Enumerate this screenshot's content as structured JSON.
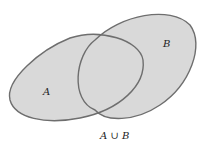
{
  "diagram": {
    "type": "venn",
    "sets": [
      {
        "label": "A"
      },
      {
        "label": "B"
      }
    ],
    "caption": "A ∪ B",
    "colors": {
      "fill": "#d9d9d9",
      "stroke": "#6e6e6e"
    }
  }
}
